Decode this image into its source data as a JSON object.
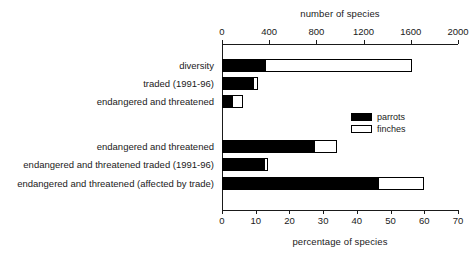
{
  "chart_data": {
    "type": "bar",
    "orientation": "horizontal",
    "title": "",
    "top_axis": {
      "label": "number of species",
      "ticks": [
        0,
        400,
        800,
        1200,
        1600,
        2000
      ],
      "lim": [
        0,
        2000
      ]
    },
    "bottom_axis": {
      "label": "percentage of species",
      "ticks": [
        0,
        10,
        20,
        30,
        40,
        50,
        60,
        70
      ],
      "lim": [
        0,
        70
      ]
    },
    "legend": {
      "position": "center-right",
      "entries": [
        {
          "name": "parrots",
          "color": "#000000"
        },
        {
          "name": "finches",
          "color": "#ffffff"
        }
      ]
    },
    "groups": [
      {
        "axis": "top",
        "rows": [
          {
            "category": "diversity",
            "parrots": 364,
            "finches": 1246,
            "total": 1610
          },
          {
            "category": "traded (1991-96)",
            "parrots": 263,
            "finches": 42,
            "total": 305
          },
          {
            "category": "endangered and threatened",
            "parrots": 85,
            "finches": 93,
            "total": 178
          }
        ]
      },
      {
        "axis": "bottom",
        "rows": [
          {
            "category": "endangered and threatened",
            "parrots": 27.3,
            "finches": 6.8,
            "total": 34.1
          },
          {
            "category": "endangered and threatened traded (1991-96)",
            "parrots": 12.5,
            "finches": 1.2,
            "total": 13.7
          },
          {
            "category": "endangered and threatened (affected by trade)",
            "parrots": 46.3,
            "finches": 13.6,
            "total": 59.9
          }
        ]
      }
    ],
    "grid": false,
    "stacked": true
  }
}
